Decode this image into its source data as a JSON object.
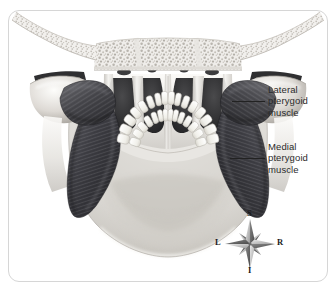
{
  "figure": {
    "view": "Posterior view of skull and mandible",
    "style": "grayscale medical illustration",
    "frame": {
      "border_color": "#d6d6d6",
      "background_color": "#ffffff"
    }
  },
  "labels": [
    {
      "id": "lateral-pterygoid",
      "text": "Lateral\npterygoid\nmuscle",
      "line1": "Lateral",
      "line2": "pterygoid",
      "line3": "muscle",
      "leader_line": true
    },
    {
      "id": "medial-pterygoid",
      "text": "Medial\npterygoid\nmuscle",
      "line1": "Medial",
      "line2": "pterygoid",
      "line3": "muscle",
      "leader_line": true
    }
  ],
  "compass": {
    "name": "orientation-compass-rose",
    "points": 8,
    "superior": "S",
    "inferior": "I",
    "left": "L",
    "right": "R"
  },
  "anatomy": {
    "structures": [
      "zygomatic arch",
      "trabecular bone",
      "nasal cavity",
      "vomer",
      "mandibular condyle",
      "maxillary teeth",
      "mandibular teeth",
      "mandible body",
      "lateral pterygoid muscle",
      "medial pterygoid muscle"
    ],
    "colors": {
      "bone_light": "#f2f1ef",
      "bone_mid": "#d9d7d3",
      "bone_shadow": "#9d9a95",
      "muscle_dark": "#3a3a3c",
      "muscle_mid": "#55555a",
      "cavity_dark": "#2e2e30",
      "tooth_white": "#fbfbf8"
    }
  }
}
